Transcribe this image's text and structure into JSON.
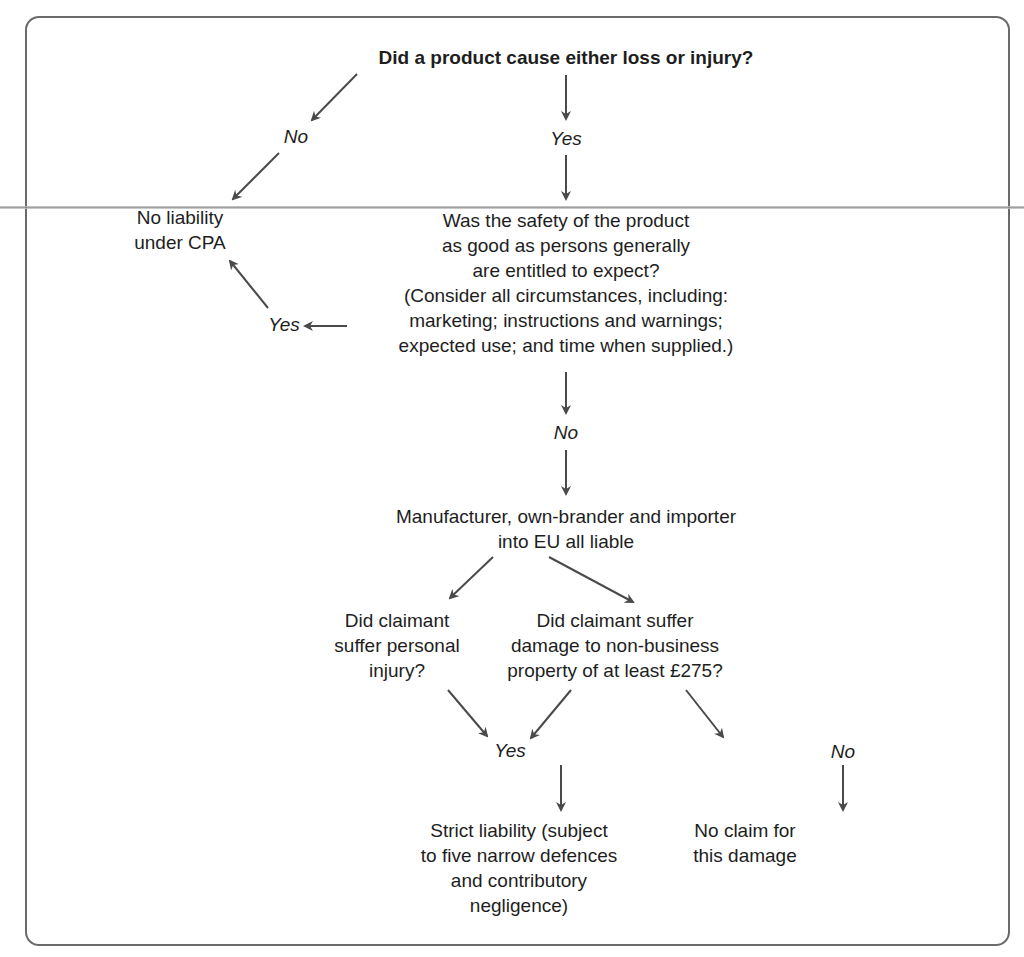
{
  "diagram": {
    "type": "flowchart",
    "nodes": {
      "start": "Did a product cause either loss or injury?",
      "no_liability": [
        "No liability",
        "under CPA"
      ],
      "safety_question": [
        "Was the safety of the product",
        "as good as persons generally",
        "are entitled to expect?",
        "(Consider all circumstances, including:",
        "marketing; instructions and warnings;",
        "expected use; and time when supplied.)"
      ],
      "liable_parties": [
        "Manufacturer, own-brander and importer",
        "into EU all liable"
      ],
      "personal_injury_question": [
        "Did claimant",
        "suffer personal",
        "injury?"
      ],
      "property_damage_question": [
        "Did claimant suffer",
        "damage to non-business",
        "property of at least £275?"
      ],
      "strict_liability": [
        "Strict liability (subject",
        "to five narrow defences",
        "and contributory",
        "negligence)"
      ],
      "no_claim": [
        "No claim for",
        "this damage"
      ]
    },
    "labels": {
      "start_no": "No",
      "start_yes": "Yes",
      "safety_yes": "Yes",
      "safety_no": "No",
      "damage_yes": "Yes",
      "damage_no": "No"
    },
    "edges": [
      {
        "from": "start",
        "to": "no_liability",
        "label": "No"
      },
      {
        "from": "start",
        "to": "safety_question",
        "label": "Yes"
      },
      {
        "from": "safety_question",
        "to": "no_liability",
        "label": "Yes"
      },
      {
        "from": "safety_question",
        "to": "liable_parties",
        "label": "No"
      },
      {
        "from": "liable_parties",
        "to": "personal_injury_question",
        "label": ""
      },
      {
        "from": "liable_parties",
        "to": "property_damage_question",
        "label": ""
      },
      {
        "from": "personal_injury_question",
        "to": "strict_liability",
        "label": "Yes"
      },
      {
        "from": "property_damage_question",
        "to": "strict_liability",
        "label": "Yes"
      },
      {
        "from": "property_damage_question",
        "to": "no_claim",
        "label": "No"
      }
    ],
    "colors": {
      "line": "#4a4a4a",
      "frame": "#6a6a6a",
      "text": "#1e1e1e"
    }
  }
}
